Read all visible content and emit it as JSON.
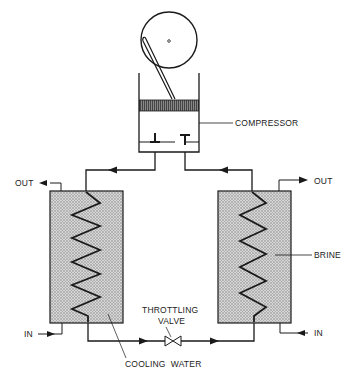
{
  "diagram": {
    "type": "vapor-compression refrigeration cycle schematic",
    "labels": {
      "compressor": "COMPRESSOR",
      "condenser_out": "OUT",
      "condenser_in": "IN",
      "evaporator_out": "OUT",
      "evaporator_in": "IN",
      "brine": "BRINE",
      "throttling_line1": "THROTTLING",
      "throttling_line2": "VALVE",
      "cooling_water": "COOLING  WATER"
    },
    "components": [
      {
        "id": "compressor",
        "name": "Compressor"
      },
      {
        "id": "condenser",
        "name": "Condenser (cooling water)"
      },
      {
        "id": "evaporator",
        "name": "Evaporator (brine)"
      },
      {
        "id": "throttling-valve",
        "name": "Throttling valve"
      }
    ],
    "colors": {
      "line": "#1a1a1a",
      "fill_stipple": "#c9c9c9",
      "background": "#ffffff"
    }
  }
}
